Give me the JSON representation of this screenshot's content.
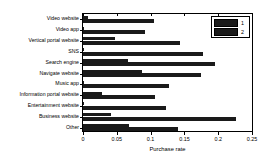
{
  "chart_data": {
    "type": "bar",
    "orientation": "horizontal",
    "title": "",
    "xlabel": "Purchase rate",
    "ylabel": "",
    "xlim": [
      0,
      0.25
    ],
    "xticks": [
      "0",
      "0.05",
      "0.1",
      "0.15",
      "0.2",
      "0.25"
    ],
    "xtick_values": [
      0,
      0.05,
      0.1,
      0.15,
      0.2,
      0.25
    ],
    "grid": false,
    "legend_position": "top-right",
    "categories": [
      "Video website",
      "Video app",
      "Vertical portal website",
      "SNS",
      "Search engine",
      "Navigate website",
      "Music app",
      "Information portal website",
      "Entertainment website",
      "Business website",
      "Other"
    ],
    "series": [
      {
        "name": "1",
        "color": "#1a1a1a",
        "values": [
          0.008,
          0.0,
          0.047,
          0.0,
          0.066,
          0.088,
          0.0,
          0.028,
          0.0,
          0.042,
          0.068
        ]
      },
      {
        "name": "2",
        "color": "#1a1a1a",
        "values": [
          0.105,
          0.092,
          0.144,
          0.178,
          0.196,
          0.175,
          0.127,
          0.106,
          0.123,
          0.227,
          0.14
        ]
      }
    ]
  },
  "legend": {
    "entries": [
      {
        "label": "1"
      },
      {
        "label": "2"
      }
    ]
  }
}
